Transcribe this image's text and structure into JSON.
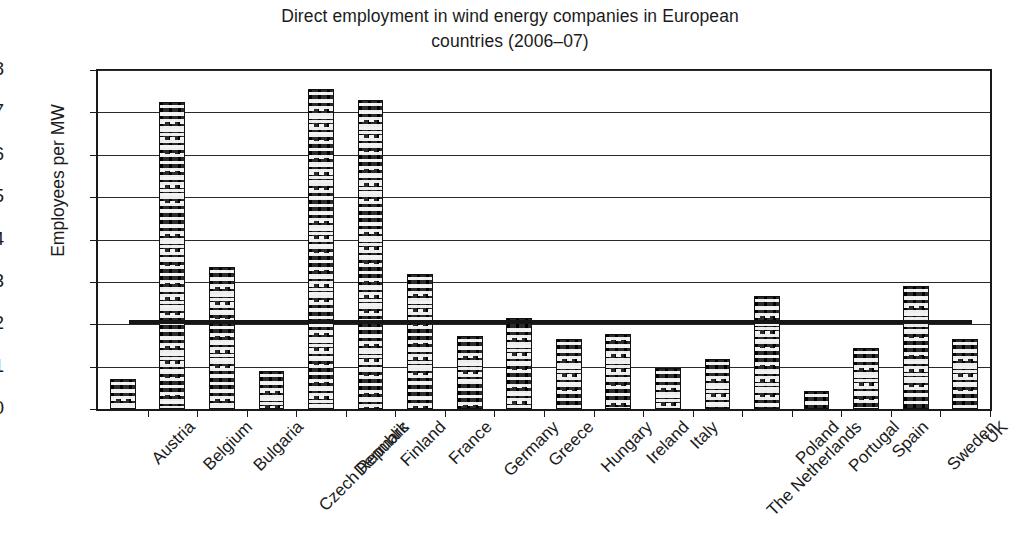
{
  "chart_data": {
    "type": "bar",
    "title": "Direct employment in wind energy companies in European countries (2006–07)",
    "title_line1": "Direct employment in wind energy companies in European",
    "title_line2": "countries (2006–07)",
    "xlabel": "",
    "ylabel": "Employees per MW",
    "ylim": [
      0,
      8
    ],
    "ytick_labels": [
      "0",
      "1",
      "2",
      "3",
      "4",
      "5",
      "6",
      "7",
      "8"
    ],
    "ytick_values": [
      0,
      1,
      2,
      3,
      4,
      5,
      6,
      7,
      8
    ],
    "grid": "horizontal",
    "legend": "none",
    "categories": [
      "Austria",
      "Belgium",
      "Bulgaria",
      "Czech Republic",
      "Denmark",
      "Finland",
      "France",
      "Germany",
      "Greece",
      "Hungary",
      "Ireland",
      "Italy",
      "The Netherlands",
      "Poland",
      "Portugal",
      "Spain",
      "Sweden",
      "UK"
    ],
    "values": [
      0.72,
      7.24,
      3.35,
      0.9,
      7.55,
      7.3,
      3.18,
      1.73,
      2.15,
      1.66,
      1.78,
      0.97,
      1.18,
      2.66,
      0.42,
      1.45,
      2.9,
      1.66
    ],
    "series": [
      {
        "name": "Employees per MW",
        "values": [
          0.72,
          7.24,
          3.35,
          0.9,
          7.55,
          7.3,
          3.18,
          1.73,
          2.15,
          1.66,
          1.78,
          0.97,
          1.18,
          2.66,
          0.42,
          1.45,
          2.9,
          1.66
        ]
      }
    ],
    "annotations": [
      {
        "name": "average-line",
        "type": "horizontal-line",
        "value": 2.05,
        "label": ""
      }
    ],
    "colors": {
      "bar_fill": "#2b2b2b",
      "bar_pattern": "#f2f2f2",
      "axis": "#1a1a1a",
      "gridline": "#2a2a2a",
      "average_line": "#161616",
      "background": "#ffffff",
      "text": "#1b1b1b"
    }
  }
}
